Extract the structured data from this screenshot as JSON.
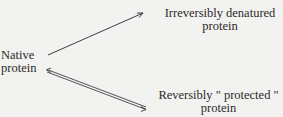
{
  "diagram": {
    "nodes": {
      "native": {
        "line1": "Native",
        "line2": "protein"
      },
      "irreversible": {
        "line1": "Irreversibly denatured",
        "line2": "protein"
      },
      "reversible": {
        "line1": "Reversibly \" protected \"",
        "line2": "protein"
      }
    },
    "edges": [
      {
        "from": "native",
        "to": "irreversible",
        "type": "single-arrow"
      },
      {
        "from": "native",
        "to": "reversible",
        "type": "equilibrium-double-arrow"
      }
    ],
    "colors": {
      "background": "#f2f2f0",
      "ink": "#2a2a2a"
    }
  }
}
